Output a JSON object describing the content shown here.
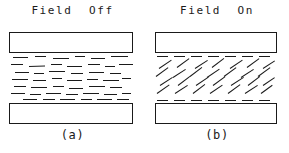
{
  "figure": {
    "type": "liquid-crystal-cell-diagram",
    "background_color": "#ffffff",
    "line_color": "#1a1a1a",
    "panels": [
      {
        "id": "a",
        "title": "Field  Off",
        "caption": "(a)",
        "state": "field-off",
        "molecule_orientation": "random-horizontal",
        "electrodes": [
          "top-plate",
          "bottom-plate"
        ]
      },
      {
        "id": "b",
        "title": "Field  On",
        "caption": "(b)",
        "state": "field-on",
        "molecule_orientation": "tilted-aligned",
        "electrodes": [
          "top-plate",
          "bottom-plate"
        ]
      }
    ]
  },
  "chart_data": {
    "type": "diagram",
    "panel_a": {
      "label": "Field  Off",
      "caption": "(a)",
      "description": "Nematic molecules lie randomly in near-horizontal orientations between two electrode plates.",
      "molecules": [
        {
          "x": 4,
          "y": 3,
          "len": 15,
          "angle": 0
        },
        {
          "x": 26,
          "y": 2,
          "len": 11,
          "angle": 0
        },
        {
          "x": 44,
          "y": 4,
          "len": 16,
          "angle": 0
        },
        {
          "x": 66,
          "y": 2,
          "len": 10,
          "angle": 0
        },
        {
          "x": 82,
          "y": 4,
          "len": 14,
          "angle": 0
        },
        {
          "x": 102,
          "y": 2,
          "len": 17,
          "angle": 0
        },
        {
          "x": 2,
          "y": 10,
          "len": 12,
          "angle": 0
        },
        {
          "x": 20,
          "y": 12,
          "len": 16,
          "angle": -2
        },
        {
          "x": 42,
          "y": 10,
          "len": 11,
          "angle": 0
        },
        {
          "x": 58,
          "y": 12,
          "len": 15,
          "angle": 0
        },
        {
          "x": 79,
          "y": 10,
          "len": 12,
          "angle": 0
        },
        {
          "x": 96,
          "y": 12,
          "len": 10,
          "angle": 0
        },
        {
          "x": 110,
          "y": 10,
          "len": 14,
          "angle": 0
        },
        {
          "x": 6,
          "y": 18,
          "len": 14,
          "angle": 0
        },
        {
          "x": 25,
          "y": 19,
          "len": 10,
          "angle": 0
        },
        {
          "x": 40,
          "y": 17,
          "len": 16,
          "angle": 0
        },
        {
          "x": 62,
          "y": 19,
          "len": 12,
          "angle": 0
        },
        {
          "x": 80,
          "y": 18,
          "len": 15,
          "angle": 0
        },
        {
          "x": 101,
          "y": 19,
          "len": 11,
          "angle": 0
        },
        {
          "x": 3,
          "y": 25,
          "len": 16,
          "angle": 0
        },
        {
          "x": 24,
          "y": 26,
          "len": 13,
          "angle": 0
        },
        {
          "x": 43,
          "y": 24,
          "len": 10,
          "angle": 0
        },
        {
          "x": 58,
          "y": 26,
          "len": 15,
          "angle": 0
        },
        {
          "x": 78,
          "y": 25,
          "len": 11,
          "angle": 0
        },
        {
          "x": 94,
          "y": 26,
          "len": 16,
          "angle": 0
        },
        {
          "x": 113,
          "y": 24,
          "len": 9,
          "angle": 0
        },
        {
          "x": 5,
          "y": 32,
          "len": 12,
          "angle": 0
        },
        {
          "x": 22,
          "y": 33,
          "len": 16,
          "angle": 0
        },
        {
          "x": 44,
          "y": 32,
          "len": 11,
          "angle": 0
        },
        {
          "x": 60,
          "y": 34,
          "len": 14,
          "angle": 0
        },
        {
          "x": 80,
          "y": 32,
          "len": 16,
          "angle": 0
        },
        {
          "x": 101,
          "y": 33,
          "len": 12,
          "angle": 0
        },
        {
          "x": 2,
          "y": 39,
          "len": 14,
          "angle": 0
        },
        {
          "x": 21,
          "y": 40,
          "len": 11,
          "angle": 0
        },
        {
          "x": 37,
          "y": 39,
          "len": 15,
          "angle": 0
        },
        {
          "x": 57,
          "y": 40,
          "len": 12,
          "angle": 0
        },
        {
          "x": 74,
          "y": 39,
          "len": 16,
          "angle": 0
        },
        {
          "x": 95,
          "y": 40,
          "len": 13,
          "angle": 0
        },
        {
          "x": 113,
          "y": 39,
          "len": 9,
          "angle": 0
        },
        {
          "x": 14,
          "y": 45,
          "len": 14,
          "angle": 0
        },
        {
          "x": 34,
          "y": 45,
          "len": 12,
          "angle": 0
        },
        {
          "x": 51,
          "y": 45,
          "len": 15,
          "angle": 0
        },
        {
          "x": 72,
          "y": 45,
          "len": 11,
          "angle": 0
        },
        {
          "x": 88,
          "y": 45,
          "len": 15,
          "angle": 0
        },
        {
          "x": 108,
          "y": 45,
          "len": 12,
          "angle": 0
        }
      ]
    },
    "panel_b": {
      "label": "Field  On",
      "caption": "(b)",
      "description": "Under an applied field the molecules tilt into a common aligned direction of roughly 35 degrees; boundary layers adjacent to the electrodes remain horizontal.",
      "tilt_angle_degrees": -35,
      "molecules": [
        {
          "x": 2,
          "y": 2,
          "len": 11,
          "angle": 0
        },
        {
          "x": 19,
          "y": 2,
          "len": 11,
          "angle": 0
        },
        {
          "x": 36,
          "y": 2,
          "len": 11,
          "angle": 0
        },
        {
          "x": 53,
          "y": 2,
          "len": 11,
          "angle": 0
        },
        {
          "x": 70,
          "y": 2,
          "len": 11,
          "angle": 0
        },
        {
          "x": 87,
          "y": 2,
          "len": 11,
          "angle": 0
        },
        {
          "x": 104,
          "y": 2,
          "len": 11,
          "angle": 0
        },
        {
          "x": 4,
          "y": 14,
          "len": 15,
          "angle": -34
        },
        {
          "x": 22,
          "y": 13,
          "len": 15,
          "angle": -36
        },
        {
          "x": 40,
          "y": 14,
          "len": 15,
          "angle": -33
        },
        {
          "x": 57,
          "y": 13,
          "len": 15,
          "angle": -37
        },
        {
          "x": 75,
          "y": 14,
          "len": 15,
          "angle": -34
        },
        {
          "x": 92,
          "y": 13,
          "len": 15,
          "angle": -36
        },
        {
          "x": 108,
          "y": 14,
          "len": 14,
          "angle": -33
        },
        {
          "x": 1,
          "y": 22,
          "len": 15,
          "angle": -36
        },
        {
          "x": 18,
          "y": 23,
          "len": 15,
          "angle": -33
        },
        {
          "x": 35,
          "y": 22,
          "len": 15,
          "angle": -37
        },
        {
          "x": 52,
          "y": 23,
          "len": 15,
          "angle": -34
        },
        {
          "x": 69,
          "y": 22,
          "len": 15,
          "angle": -36
        },
        {
          "x": 86,
          "y": 23,
          "len": 15,
          "angle": -33
        },
        {
          "x": 103,
          "y": 22,
          "len": 15,
          "angle": -36
        },
        {
          "x": 5,
          "y": 31,
          "len": 15,
          "angle": -33
        },
        {
          "x": 23,
          "y": 31,
          "len": 15,
          "angle": -37
        },
        {
          "x": 41,
          "y": 31,
          "len": 15,
          "angle": -34
        },
        {
          "x": 58,
          "y": 31,
          "len": 15,
          "angle": -36
        },
        {
          "x": 76,
          "y": 31,
          "len": 15,
          "angle": -33
        },
        {
          "x": 93,
          "y": 31,
          "len": 15,
          "angle": -37
        },
        {
          "x": 108,
          "y": 31,
          "len": 14,
          "angle": -34
        },
        {
          "x": 2,
          "y": 39,
          "len": 15,
          "angle": -35
        },
        {
          "x": 20,
          "y": 39,
          "len": 15,
          "angle": -33
        },
        {
          "x": 38,
          "y": 39,
          "len": 15,
          "angle": -37
        },
        {
          "x": 55,
          "y": 39,
          "len": 15,
          "angle": -34
        },
        {
          "x": 73,
          "y": 39,
          "len": 15,
          "angle": -36
        },
        {
          "x": 90,
          "y": 39,
          "len": 15,
          "angle": -33
        },
        {
          "x": 106,
          "y": 39,
          "len": 14,
          "angle": -36
        },
        {
          "x": 2,
          "y": 46,
          "len": 11,
          "angle": 0
        },
        {
          "x": 19,
          "y": 46,
          "len": 11,
          "angle": 0
        },
        {
          "x": 36,
          "y": 46,
          "len": 11,
          "angle": 0
        },
        {
          "x": 53,
          "y": 46,
          "len": 11,
          "angle": 0
        },
        {
          "x": 70,
          "y": 46,
          "len": 11,
          "angle": 0
        },
        {
          "x": 87,
          "y": 46,
          "len": 11,
          "angle": 0
        },
        {
          "x": 104,
          "y": 46,
          "len": 11,
          "angle": 0
        }
      ]
    }
  }
}
